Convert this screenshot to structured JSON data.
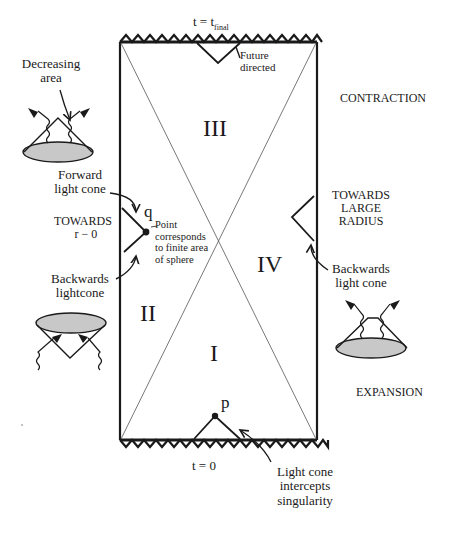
{
  "diagram": {
    "title_top": {
      "prefix": "t = t",
      "subscript": "final"
    },
    "title_bottom": "t = 0",
    "regions": [
      "I",
      "II",
      "III",
      "IV"
    ],
    "points": {
      "p": "p",
      "q": "q"
    },
    "side_labels": {
      "contraction": "CONTRACTION",
      "expansion": "EXPANSION",
      "towards_large_radius": [
        "TOWARDS",
        "LARGE",
        "RADIUS"
      ],
      "towards_r0": [
        "TOWARDS",
        "r − 0"
      ]
    },
    "annotations": {
      "decreasing_area": [
        "Decreasing",
        "area"
      ],
      "forward_light_cone": [
        "Forward",
        "light  cone"
      ],
      "backwards_lightcone": [
        "Backwards",
        "lightcone"
      ],
      "backwards_light_cone_right": [
        "Backwards",
        "light  cone"
      ],
      "future_directed": [
        "Future",
        "directed"
      ],
      "point_corresponds": [
        "Point",
        "corresponds",
        "to finite area",
        "of sphere"
      ],
      "light_cone_intercepts": [
        "Light  cone",
        "intercepts",
        "singularity"
      ]
    },
    "colors": {
      "ink": "#1a1a1a",
      "cone_fill": "#c8c8c8",
      "background": "#ffffff"
    }
  }
}
